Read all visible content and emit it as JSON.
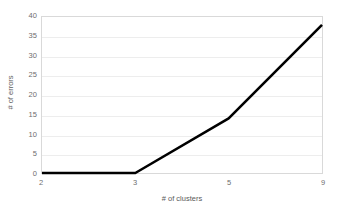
{
  "chart_data": {
    "type": "line",
    "title": "",
    "xlabel": "# of clusters",
    "ylabel": "# of errors",
    "x": [
      2,
      3,
      5,
      9
    ],
    "categories": [
      "2",
      "3",
      "5",
      "9"
    ],
    "values": [
      0,
      0,
      14,
      38
    ],
    "series": [
      {
        "name": "# of errors",
        "values": [
          0,
          0,
          14,
          38
        ]
      }
    ],
    "xtick_labels": [
      "2",
      "3",
      "5",
      "9"
    ],
    "ytick_labels": [
      "0",
      "5",
      "10",
      "15",
      "20",
      "25",
      "30",
      "35",
      "40"
    ],
    "ytick_values": [
      0,
      5,
      10,
      15,
      20,
      25,
      30,
      35,
      40
    ],
    "ylim": [
      0,
      40
    ],
    "grid": "horizontal",
    "legend": "none",
    "line_color": "#000000",
    "grid_color": "#ededed",
    "border_color": "#d9d9d9",
    "background_color": "#ffffff",
    "tick_label_color": "#6e6e6e"
  }
}
